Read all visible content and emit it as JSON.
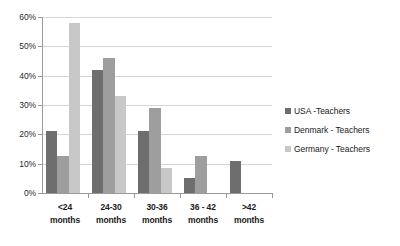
{
  "chart_data": {
    "type": "bar",
    "title": "",
    "xlabel": "",
    "ylabel": "",
    "ylim": [
      0,
      60
    ],
    "ytick_labels": [
      "0%",
      "10%",
      "20%",
      "30%",
      "40%",
      "50%",
      "60%"
    ],
    "ytick_values": [
      0,
      10,
      20,
      30,
      40,
      50,
      60
    ],
    "grid": true,
    "legend_position": "right",
    "categories": [
      "<24\nmonths",
      "24-30\nmonths",
      "30-36\nmonths",
      "36 - 42\nmonths",
      ">42\nmonths"
    ],
    "category_lines": [
      [
        "<24",
        "months"
      ],
      [
        "24-30",
        "months"
      ],
      [
        "30-36",
        "months"
      ],
      [
        "36 - 42",
        "months"
      ],
      [
        ">42",
        "months"
      ]
    ],
    "series": [
      {
        "name": "USA -Teachers",
        "color": "#6e6e6e",
        "values": [
          21,
          42,
          21,
          5,
          11
        ]
      },
      {
        "name": "Denmark - Teachers",
        "color": "#9e9e9e",
        "values": [
          12.5,
          46,
          29,
          12.5,
          null
        ]
      },
      {
        "name": "Germany - Teachers",
        "color": "#c8c8c8",
        "values": [
          58,
          33,
          8.5,
          null,
          null
        ]
      }
    ]
  },
  "legend": {
    "items": [
      {
        "label": "USA -Teachers",
        "color": "#6e6e6e"
      },
      {
        "label": "Denmark - Teachers",
        "color": "#9e9e9e"
      },
      {
        "label": "Germany - Teachers",
        "color": "#c8c8c8"
      }
    ]
  },
  "axis_colors": {
    "axis_line": "#9a9a9a",
    "gridline": "#d6d6d6",
    "tick_text": "#2b2b2b",
    "label_text": "#1a1a1a"
  }
}
